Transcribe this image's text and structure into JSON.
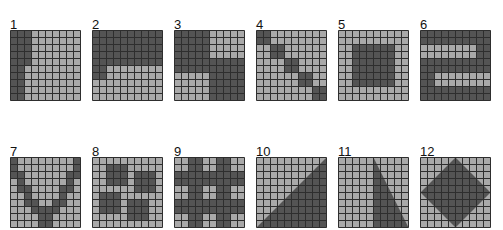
{
  "colors": {
    "dark": "#545454",
    "light": "#a9a9a9",
    "grid_line": "#2e2e2e"
  },
  "grid_size": 10,
  "panels": [
    {
      "label": "1",
      "x": 10,
      "y": 18,
      "type": "cells",
      "dark": [
        "0:0-2",
        "1:0-2",
        "2:0-2",
        "3:0-2",
        "4:0-2",
        "5:0-1",
        "6:0-1",
        "7:0-1",
        "8:0-1",
        "9:0-1"
      ]
    },
    {
      "label": "2",
      "x": 92,
      "y": 18,
      "type": "cells",
      "dark": [
        "0:0-9",
        "1:0-9",
        "2:0-9",
        "3:0-9",
        "4:0-9",
        "5:0-1",
        "6:0-1"
      ]
    },
    {
      "label": "3",
      "x": 174,
      "y": 18,
      "type": "cells",
      "dark": [
        "0:0-4",
        "1:0-4",
        "2:0-4",
        "3:0-4",
        "4:0-9",
        "5:0-9",
        "6:5-9",
        "7:5-9",
        "8:5-9",
        "9:5-9"
      ]
    },
    {
      "label": "4",
      "x": 256,
      "y": 18,
      "type": "cells",
      "dark": [
        "0:0-1",
        "1:0-1",
        "2:2-3",
        "3:2-3",
        "4:4-5",
        "5:4-5",
        "6:6-7",
        "7:6-7",
        "8:8-9",
        "9:8-9"
      ]
    },
    {
      "label": "5",
      "x": 338,
      "y": 18,
      "type": "cells",
      "dark": [
        "2:2-7",
        "3:2-7",
        "4:2-7",
        "5:2-7",
        "6:2-7",
        "7:2-7"
      ]
    },
    {
      "label": "6",
      "x": 420,
      "y": 18,
      "type": "cells",
      "dark": [
        "0:0-9",
        "1:0-9",
        "2:8-9",
        "3:8-9",
        "4:0-9",
        "5:0-9",
        "6:0-1",
        "7:0-1",
        "8:0-9",
        "9:0-9"
      ]
    },
    {
      "label": "7",
      "x": 10,
      "y": 145,
      "type": "cells",
      "dark": [
        "0:0-0",
        "0:9-9",
        "1:0-0",
        "1:9-9",
        "2:0-1",
        "2:8-9",
        "3:1-1",
        "3:8-8",
        "4:1-2",
        "4:7-8",
        "5:2-2",
        "5:7-7",
        "6:2-3",
        "6:6-7",
        "7:3-4",
        "7:5-6",
        "8:4-5",
        "9:4-5"
      ]
    },
    {
      "label": "8",
      "x": 92,
      "y": 145,
      "type": "cells",
      "dark": [
        "1:2-4",
        "2:2-4",
        "2:6-8",
        "3:2-4",
        "3:6-8",
        "4:6-8",
        "5:1-3",
        "6:1-3",
        "6:5-7",
        "7:1-3",
        "7:5-7",
        "8:5-7"
      ]
    },
    {
      "label": "9",
      "x": 174,
      "y": 145,
      "type": "cells",
      "dark": [
        "0:2-3",
        "0:6-7",
        "1:2-3",
        "1:6-7",
        "2:0-9",
        "3:0-9",
        "4:2-3",
        "4:6-7",
        "5:2-3",
        "5:6-7",
        "6:0-9",
        "7:0-9",
        "8:2-3",
        "8:6-7",
        "9:2-3",
        "9:6-7"
      ]
    },
    {
      "label": "10",
      "x": 256,
      "y": 145,
      "type": "polygon",
      "points": [
        [
          10,
          0
        ],
        [
          10,
          10
        ],
        [
          0,
          10
        ]
      ]
    },
    {
      "label": "11",
      "x": 338,
      "y": 145,
      "type": "polygon",
      "points": [
        [
          5,
          0
        ],
        [
          10,
          10
        ],
        [
          5,
          10
        ]
      ]
    },
    {
      "label": "12",
      "x": 420,
      "y": 145,
      "type": "polygon",
      "points": [
        [
          5,
          0
        ],
        [
          10,
          5
        ],
        [
          5,
          10
        ],
        [
          0,
          5
        ]
      ]
    }
  ]
}
